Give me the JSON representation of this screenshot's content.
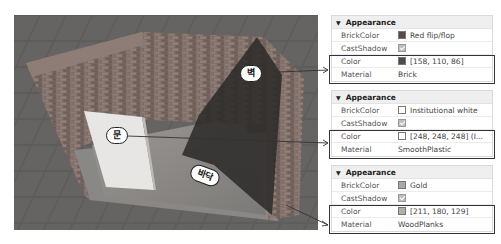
{
  "scene": {
    "labels": {
      "wall": "벽",
      "door": "문",
      "floor": "바닥"
    }
  },
  "panels": [
    {
      "section": "Appearance",
      "rows": [
        {
          "key": "BrickColor",
          "value": "Red flip/flop",
          "swatch": "#5a4a47"
        },
        {
          "key": "CastShadow",
          "value": "",
          "checkbox": true
        },
        {
          "key": "Color",
          "value": "[158, 110, 86]",
          "swatch": "#4e4a48"
        },
        {
          "key": "Material",
          "value": "Brick"
        }
      ]
    },
    {
      "section": "Appearance",
      "rows": [
        {
          "key": "BrickColor",
          "value": "Institutional white",
          "swatch": "#ffffff"
        },
        {
          "key": "CastShadow",
          "value": "",
          "checkbox": true
        },
        {
          "key": "Color",
          "value": "[248, 248, 248] (I...",
          "swatch": "#ffffff"
        },
        {
          "key": "Material",
          "value": "SmoothPlastic"
        }
      ]
    },
    {
      "section": "Appearance",
      "rows": [
        {
          "key": "BrickColor",
          "value": "Gold",
          "swatch": "#a9a9a9"
        },
        {
          "key": "CastShadow",
          "value": "",
          "checkbox": true
        },
        {
          "key": "Color",
          "value": "[211, 180, 129]",
          "swatch": "#b0aeab"
        },
        {
          "key": "Material",
          "value": "WoodPlanks"
        }
      ]
    }
  ]
}
